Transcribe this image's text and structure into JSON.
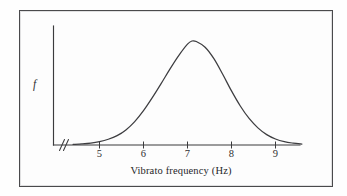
{
  "figure": {
    "frame_color": "#4a4a4c",
    "background_color": "#fdfdfd",
    "ink_color": "#3b3b3d"
  },
  "axes": {
    "y_label": "f",
    "x_label": "Vibrato frequency (Hz)",
    "axis_break_symbol": "//"
  },
  "chart_data": {
    "type": "line",
    "title": "",
    "subtitle": "",
    "xlabel": "Vibrato frequency (Hz)",
    "ylabel": "f",
    "xlim": [
      4.4,
      10.0
    ],
    "ylim": [
      0,
      1.08
    ],
    "grid": false,
    "legend": null,
    "xticks": [
      5,
      6,
      7,
      8,
      9
    ],
    "xtick_labels": [
      "5",
      "6",
      "7",
      "8",
      "9"
    ],
    "yticks": [],
    "ytick_labels": [],
    "annotations": [
      "axis break on x-axis near origin"
    ],
    "series": [
      {
        "name": "Vibrato frequency density",
        "description": "Unimodal bell-shaped probability density peaking near 7.1 Hz",
        "x": [
          4.4,
          4.6,
          4.8,
          5.0,
          5.2,
          5.4,
          5.6,
          5.8,
          6.0,
          6.2,
          6.4,
          6.6,
          6.8,
          7.0,
          7.1,
          7.2,
          7.4,
          7.6,
          7.8,
          8.0,
          8.2,
          8.4,
          8.6,
          8.8,
          9.0,
          9.2,
          9.4,
          9.6,
          9.8
        ],
        "y": [
          0.005,
          0.01,
          0.018,
          0.032,
          0.055,
          0.09,
          0.145,
          0.225,
          0.33,
          0.455,
          0.59,
          0.73,
          0.86,
          0.97,
          1.0,
          0.995,
          0.94,
          0.83,
          0.68,
          0.52,
          0.375,
          0.255,
          0.165,
          0.1,
          0.058,
          0.032,
          0.018,
          0.009,
          0.004
        ]
      }
    ]
  }
}
